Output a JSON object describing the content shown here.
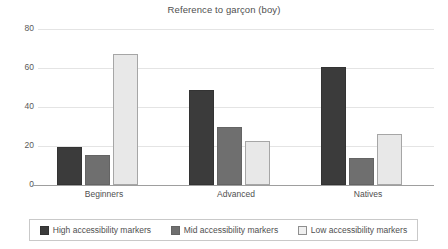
{
  "chart_data": {
    "type": "bar",
    "title": "Reference to garçon (boy)",
    "xlabel": "",
    "ylabel": "",
    "ylim": [
      0,
      80
    ],
    "yticks": [
      0,
      20,
      40,
      60,
      80
    ],
    "grid": true,
    "legend_position": "bottom",
    "categories": [
      "Beginners",
      "Advanced",
      "Natives"
    ],
    "series": [
      {
        "name": "High accessibility markers",
        "color": "#3b3b3b",
        "values": [
          18.5,
          47.5,
          59.5
        ]
      },
      {
        "name": "Mid accessibility markers",
        "color": "#6f6f6f",
        "values": [
          14.5,
          28.5,
          13
        ]
      },
      {
        "name": "Low accessibility markers",
        "color": "#e8e8e8",
        "values": [
          66,
          21.5,
          25
        ]
      }
    ]
  }
}
